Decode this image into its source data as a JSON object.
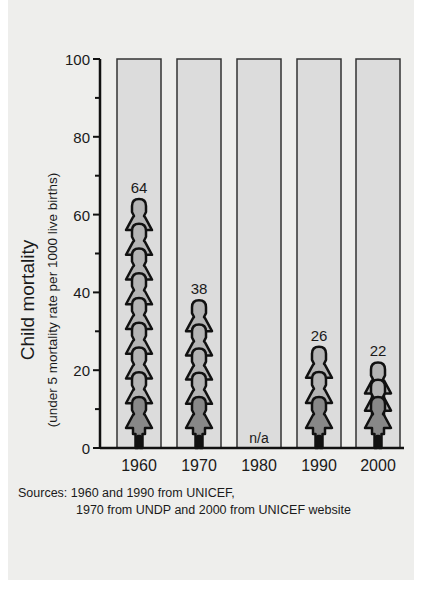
{
  "chart_data": {
    "type": "bar",
    "title": "",
    "xlabel": "",
    "ylabel": "Child mortality",
    "ylabel_sub": "(under 5 mortality rate per 1000 live births)",
    "categories": [
      "1960",
      "1970",
      "1980",
      "1990",
      "2000"
    ],
    "values": [
      64,
      38,
      null,
      26,
      22
    ],
    "value_labels": [
      "64",
      "38",
      "n/a",
      "26",
      "22"
    ],
    "figure_counts": [
      9,
      5,
      0,
      3,
      3
    ],
    "ylim": [
      0,
      100
    ],
    "yticks": [
      0,
      20,
      40,
      60,
      80,
      100
    ],
    "yminor_ticks": [
      10,
      30,
      50,
      70,
      90
    ],
    "grid": false,
    "legend": null,
    "background_bar_value": 100,
    "colors": {
      "bar_fill": "#dcdcdc",
      "bar_border": "#333333",
      "figure_fill": "#888888",
      "figure_outline": "#111111",
      "panel_bg": "#eeeeec"
    }
  },
  "sources": {
    "line1": "Sources: 1960 and 1990 from UNICEF,",
    "line2": "1970 from UNDP and 2000 from UNICEF website"
  }
}
